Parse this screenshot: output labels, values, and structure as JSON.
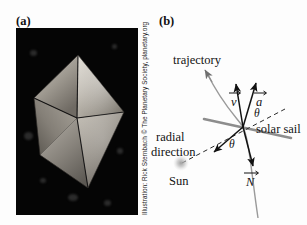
{
  "figure": {
    "background_color": "#fdfdfd",
    "width": 307,
    "height": 225
  },
  "panel_a": {
    "label": "(a)",
    "photo": {
      "alt_name": "solar-sail-spacecraft-photo",
      "background_color": "#050505",
      "subject": "four-quadrant square solar sail seen at an angle against black space"
    },
    "credit": "Illustration: Rick Sternbach © The Planetary Society, planetary.org"
  },
  "panel_b": {
    "label": "(b)",
    "labels": {
      "trajectory": "trajectory",
      "velocity": "v",
      "acceleration": "a",
      "normal": "N",
      "theta_upper": "θ",
      "theta_lower": "θ",
      "solar_sail": "solar sail",
      "radial_line1": "radial",
      "radial_line2": "direction",
      "sun": "Sun"
    },
    "colors": {
      "ink": "#121212",
      "sail_line": "#8a8a8a",
      "trajectory_curve": "#8f8f8f",
      "sun_glow": "#b9b9b9"
    }
  }
}
